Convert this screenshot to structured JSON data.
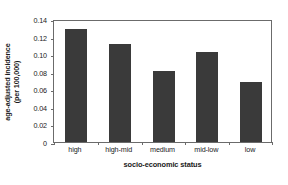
{
  "chart_data": {
    "type": "bar",
    "title": "",
    "subtitle": "",
    "categories": [
      "high",
      "high-mid",
      "medium",
      "mid-low",
      "low"
    ],
    "values": [
      0.129,
      0.112,
      0.081,
      0.102,
      0.068
    ],
    "series": [
      {
        "name": "age-adjusted incidence",
        "values": [
          0.129,
          0.112,
          0.081,
          0.102,
          0.068
        ]
      }
    ],
    "xlabel": "socio-economic status",
    "ylabel": "age-adjusted incidence (per 100,000)",
    "ylabel_line1": "age-adjusted incidence",
    "ylabel_line2": "(per 100,000)",
    "ylim": [
      0,
      0.14
    ],
    "yticks": [
      0,
      0.02,
      0.04,
      0.06,
      0.08,
      0.1,
      0.12,
      0.14
    ],
    "ytick_labels": [
      "0",
      "0.02",
      "0.04",
      "0.06",
      "0.08",
      "0.10",
      "0.12",
      "0.14"
    ],
    "grid": false,
    "legend": false,
    "legend_position": "none",
    "bar_color": "#3a3a3a",
    "axis_color": "#6b6b6b",
    "background_color": "#ffffff",
    "text_color": "#1a1a1a"
  }
}
